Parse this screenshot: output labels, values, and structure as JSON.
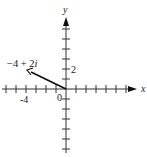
{
  "diagram": {
    "type": "complex-plane-vector",
    "axes": {
      "x_label": "x",
      "y_label": "y",
      "origin_label": "0",
      "tick_labels": [
        {
          "axis": "x",
          "value": -4,
          "text": "-4"
        },
        {
          "axis": "y",
          "value": 2,
          "text": "2"
        }
      ],
      "x_range": [
        -6,
        7
      ],
      "y_range": [
        -6,
        7
      ],
      "tick_spacing": 1
    },
    "vector": {
      "from": [
        0,
        0
      ],
      "to": [
        -4,
        2
      ],
      "label": "−4 + 2",
      "label_imag_unit": "i"
    },
    "colors": {
      "axis": "#333333",
      "vector": "#111111",
      "text": "#222222"
    }
  }
}
